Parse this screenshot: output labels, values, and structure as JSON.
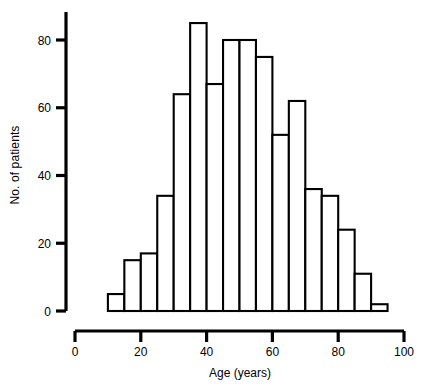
{
  "chart_data": {
    "type": "bar",
    "title": "",
    "subtitle": "",
    "xlabel": "Age (years)",
    "ylabel": "No. of patients",
    "xlim": [
      0,
      100
    ],
    "ylim": [
      0,
      92
    ],
    "grid": false,
    "legend": null,
    "xticks": [
      "0",
      "20",
      "40",
      "60",
      "80",
      "100"
    ],
    "xtick_values": [
      0,
      20,
      40,
      60,
      80,
      100
    ],
    "yticks": [
      "0",
      "20",
      "40",
      "60",
      "80"
    ],
    "ytick_values": [
      0,
      20,
      40,
      60,
      80
    ],
    "bin_width": 5,
    "bin_starts": [
      10,
      15,
      20,
      25,
      30,
      35,
      40,
      45,
      50,
      55,
      60,
      65,
      70,
      75,
      80,
      85,
      90
    ],
    "categories": [
      "10-15",
      "15-20",
      "20-25",
      "25-30",
      "30-35",
      "35-40",
      "40-45",
      "45-50",
      "50-55",
      "55-60",
      "60-65",
      "65-70",
      "70-75",
      "75-80",
      "80-85",
      "85-90",
      "90-95"
    ],
    "values": [
      5,
      15,
      17,
      34,
      64,
      85,
      67,
      80,
      80,
      75,
      52,
      62,
      36,
      34,
      24,
      11,
      2
    ],
    "bar_fill": "#ffffff",
    "bar_stroke": "#000000"
  }
}
